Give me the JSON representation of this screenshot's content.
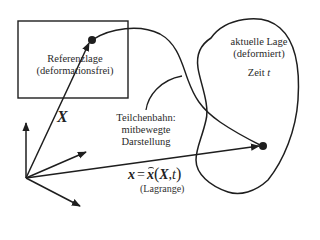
{
  "diagram": {
    "stroke_color": "#1e1e1e",
    "reference_config": {
      "line1": "Referenzlage",
      "line2": "(deformationsfrei)"
    },
    "current_config": {
      "line1": "aktuelle Lage",
      "line2": "(deformiert)",
      "time_label": "Zeit",
      "time_symbol": "t"
    },
    "particle_path": {
      "line1": "Teilchenbahn:",
      "line2": "mitbewegte",
      "line3": "Darstellung"
    },
    "position_vector_label": "X",
    "formula": {
      "lhs": "x",
      "eq": "=",
      "func": "x",
      "open": "(",
      "arg1": "X",
      "sep": ",",
      "arg2": "t",
      "close": ")",
      "description": "(Lagrange)"
    }
  }
}
